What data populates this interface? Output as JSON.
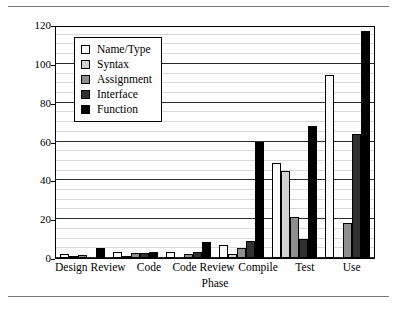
{
  "chart_data": {
    "type": "bar",
    "title": "",
    "xlabel": "Phase",
    "ylabel": "Average Fix Time (minutes)",
    "ylim": [
      0,
      120
    ],
    "ytick_values": [
      0,
      20,
      40,
      60,
      80,
      100,
      120
    ],
    "ytick_labels": [
      "0",
      "20",
      "40",
      "60",
      "80",
      "100",
      "120"
    ],
    "minor_gridline_step": 5,
    "grid": true,
    "legend_position": "upper-left-inside",
    "categories": [
      "Design Review",
      "Code",
      "Code Review",
      "Compile",
      "Test",
      "Use"
    ],
    "series": [
      {
        "name": "Name/Type",
        "color": "#fbfbfb",
        "values": [
          2,
          3,
          3,
          6.5,
          49,
          94
        ]
      },
      {
        "name": "Syntax",
        "color": "#d2d2d2",
        "values": [
          1,
          1,
          0,
          2,
          45,
          0
        ]
      },
      {
        "name": "Assignment",
        "color": "#8e8e8e",
        "values": [
          1.5,
          2.5,
          2,
          5,
          21,
          18
        ]
      },
      {
        "name": "Interface",
        "color": "#303030",
        "values": [
          0,
          2.5,
          3,
          9,
          10,
          64
        ]
      },
      {
        "name": "Function",
        "color": "#000000",
        "values": [
          5,
          3,
          8,
          60,
          68,
          117
        ]
      }
    ]
  },
  "figure": {
    "has_top_rule": true,
    "has_bottom_rule": true,
    "background": "#ffffff",
    "frame_color": "#000000"
  }
}
